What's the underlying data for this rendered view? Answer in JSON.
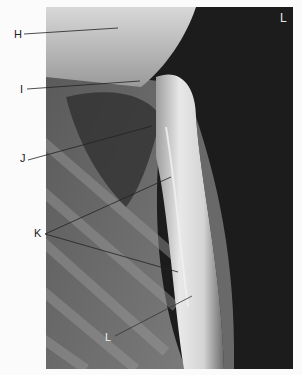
{
  "figure": {
    "type": "radiograph",
    "view": "lateral chest / sternum region",
    "side_marker": "L",
    "labels": [
      {
        "id": "H",
        "text": "H",
        "x": 14,
        "y": 34,
        "line_to": [
          118,
          28
        ]
      },
      {
        "id": "I",
        "text": "I",
        "x": 20,
        "y": 89,
        "line_to": [
          140,
          81
        ]
      },
      {
        "id": "J",
        "text": "J",
        "x": 20,
        "y": 157,
        "line_to": [
          152,
          126
        ]
      },
      {
        "id": "K",
        "text": "K",
        "x": 34,
        "y": 232,
        "line_to": [
          [
            171,
            177
          ],
          [
            178,
            272
          ]
        ]
      },
      {
        "id": "L",
        "text": "L",
        "x": 105,
        "y": 336,
        "line_to": [
          192,
          296
        ]
      }
    ],
    "colors": {
      "background": "#fbfbfb",
      "film_dark": "#1c1c1c",
      "bone_light": "#e6e6e6",
      "label_text": "#222222",
      "marker_text": "#e8e8e8"
    }
  }
}
